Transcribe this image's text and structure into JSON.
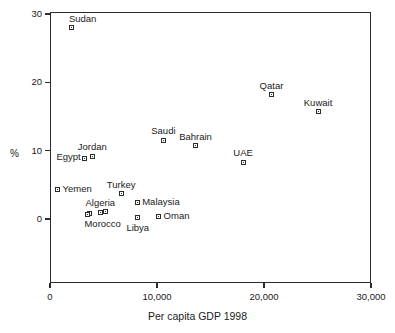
{
  "chart_data": {
    "type": "scatter",
    "title": "",
    "xlabel": "Per capita GDP 1998",
    "ylabel": "%",
    "xlim": [
      0,
      30000
    ],
    "ylim": [
      0,
      30
    ],
    "grid": false,
    "legend": null,
    "xticks": [
      {
        "value": 0,
        "label": "0"
      },
      {
        "value": 10000,
        "label": "10,000"
      },
      {
        "value": 20000,
        "label": "20,000"
      },
      {
        "value": 30000,
        "label": "30,000"
      }
    ],
    "yticks": [
      {
        "value": 0,
        "label": "0"
      },
      {
        "value": 10,
        "label": "10"
      },
      {
        "value": 20,
        "label": "20"
      },
      {
        "value": 30,
        "label": "30"
      }
    ],
    "points": [
      {
        "label": "Sudan",
        "x": 2050,
        "y": 28.0,
        "label_pos": "above"
      },
      {
        "label": "Qatar",
        "x": 20700,
        "y": 18.2,
        "label_pos": "above-ctr"
      },
      {
        "label": "Kuwait",
        "x": 25050,
        "y": 15.7,
        "label_pos": "above-ctr"
      },
      {
        "label": "Saudi",
        "x": 10600,
        "y": 11.5,
        "label_pos": "above-ctr"
      },
      {
        "label": "Bahrain",
        "x": 13600,
        "y": 10.7,
        "label_pos": "above-ctr"
      },
      {
        "label": "UAE",
        "x": 18050,
        "y": 8.3,
        "label_pos": "above-ctr"
      },
      {
        "label": "Jordan",
        "x": 3950,
        "y": 9.2,
        "label_pos": "above-ctr"
      },
      {
        "label": "Egypt",
        "x": 3250,
        "y": 8.9,
        "label_pos": "left"
      },
      {
        "label": "Yemen",
        "x": 700,
        "y": 4.3,
        "label_pos": "right"
      },
      {
        "label": "Turkey",
        "x": 6650,
        "y": 3.7,
        "label_pos": "above-ctr"
      },
      {
        "label": "Malaysia",
        "x": 8150,
        "y": 2.4,
        "label_pos": "right"
      },
      {
        "label": "Algeria",
        "x": 4700,
        "y": 1.0,
        "label_pos": "above-ctr"
      },
      {
        "label": "",
        "x": 5150,
        "y": 1.1,
        "label_pos": "none"
      },
      {
        "label": "",
        "x": 3650,
        "y": 0.8,
        "label_pos": "none"
      },
      {
        "label": "Morocco",
        "x": 3500,
        "y": 0.7,
        "label_pos": "below"
      },
      {
        "label": "Libya",
        "x": 8200,
        "y": 0.2,
        "label_pos": "below-ctr"
      },
      {
        "label": "Oman",
        "x": 10150,
        "y": 0.3,
        "label_pos": "right"
      }
    ]
  },
  "axis": {
    "ylabel_text": "%",
    "xlabel_text": "Per capita GDP 1998"
  }
}
